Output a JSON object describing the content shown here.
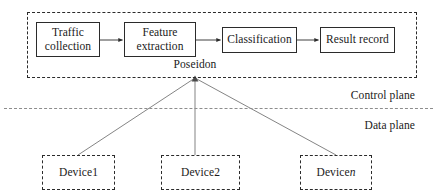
{
  "figure": {
    "width": 437,
    "height": 196,
    "background": "#ffffff",
    "line_color": "#2b2b2b",
    "divider_color": "#8d8d8d"
  },
  "control_plane": {
    "label": "Control plane",
    "container": {
      "name": "Poseidon",
      "label": "Poseidon",
      "border_style": "dashed"
    },
    "pipeline": [
      {
        "id": "traffic-collection",
        "line1": "Traffic",
        "line2": "collection"
      },
      {
        "id": "feature-extraction",
        "line1": "Feature",
        "line2": "extraction"
      },
      {
        "id": "classification",
        "line1": "Classification",
        "line2": ""
      },
      {
        "id": "result-record",
        "line1": "Result record",
        "line2": ""
      }
    ],
    "pipeline_connectors": [
      {
        "from": "traffic-collection",
        "to": "feature-extraction",
        "arrow": true
      },
      {
        "from": "feature-extraction",
        "to": "classification",
        "arrow": true
      },
      {
        "from": "classification",
        "to": "result-record",
        "arrow": true
      }
    ]
  },
  "data_plane": {
    "label": "Data plane",
    "devices": [
      {
        "id": "device1",
        "label": "Device1",
        "italic_suffix": ""
      },
      {
        "id": "device2",
        "label": "Device2",
        "italic_suffix": ""
      },
      {
        "id": "device-n",
        "label": "Device ",
        "italic_suffix": "n"
      }
    ]
  },
  "links": {
    "description": "lines from Poseidon container to each device",
    "hub": {
      "x": 195,
      "y": 78
    },
    "targets": [
      {
        "device": "device1",
        "x": 78,
        "y": 155
      },
      {
        "device": "device2",
        "x": 195,
        "y": 155
      },
      {
        "device": "device-n",
        "x": 336,
        "y": 155
      }
    ]
  }
}
